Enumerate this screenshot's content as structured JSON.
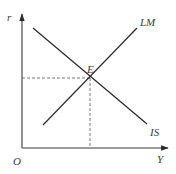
{
  "diagram": {
    "type": "IS-LM model",
    "axes": {
      "y_label": "r",
      "x_label": "Y",
      "origin_label": "O"
    },
    "curves": [
      {
        "name": "IS",
        "label": "IS",
        "slope": "downward"
      },
      {
        "name": "LM",
        "label": "LM",
        "slope": "upward"
      }
    ],
    "equilibrium": {
      "label": "E",
      "guides": [
        "horizontal dashed to r-axis",
        "vertical dashed to Y-axis"
      ]
    },
    "colors": {
      "line": "#2b2b2b",
      "axis": "#3a3a3a",
      "background": "#ffffff"
    }
  }
}
